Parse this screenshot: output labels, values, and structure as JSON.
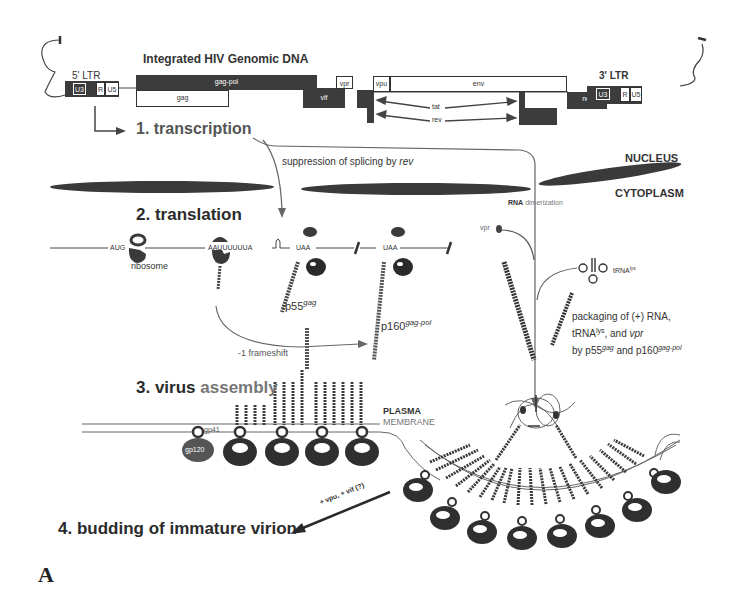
{
  "figure": {
    "panel_label": "A",
    "genome_title": "Integrated HIV Genomic DNA",
    "ltr5": {
      "label": "5' LTR",
      "segments": [
        "U3",
        "R",
        "U5"
      ]
    },
    "ltr3": {
      "label": "3' LTR",
      "segments": [
        "U3",
        "R",
        "U5"
      ]
    },
    "genes": {
      "gag_pol": "gag-pol",
      "gag": "gag",
      "vif": "vif",
      "vpr": "vpr",
      "vpu": "vpu",
      "env": "env",
      "tat": "tat",
      "rev": "rev",
      "nef": "nef"
    },
    "steps": {
      "s1": "1. transcription",
      "s2": "2. translation",
      "s3_bold": "3. virus",
      "s3_grey": "assembly",
      "s4": "4. budding of immature virion"
    },
    "annotations": {
      "splicing_prefix": "suppression of splicing by ",
      "splicing_italic": "rev",
      "nucleus": "NUCLEUS",
      "cytoplasm": "CYTOPLASM",
      "rna_dimer_bold": "RNA",
      "rna_dimer_rest": "dimerization",
      "vpr_small": "vpr",
      "trna_base": "tRNA",
      "trna_sup": "lys",
      "aug": "AUG",
      "ribosome": "ribosome",
      "slippery": "AAUUUUUUA",
      "uaa1": "UAA",
      "uaa2": "UAA",
      "p55_base": "p55",
      "p55_sup": "gag",
      "p160_base": "p160",
      "p160_sup": "gag-pol",
      "frameshift": "-1 frameshift",
      "packaging_line1": "packaging of (+) RNA,",
      "packaging_line2_a": "tRNA",
      "packaging_line2_sup": "lys",
      "packaging_line2_b": ", and ",
      "packaging_line2_it": "vpr",
      "packaging_line3_a": "by p55",
      "packaging_line3_sup1": "gag",
      "packaging_line3_b": " and p160",
      "packaging_line3_sup2": "gag-pol",
      "plasma": "PLASMA",
      "membrane": "MEMBRANE",
      "gp41": "gp41",
      "gp120": "gp120",
      "budding_arrow": "+ vpu, + vif (?)"
    },
    "colors": {
      "dark_fill": "#3c3c3c",
      "line": "#555555",
      "text": "#2a2a2a",
      "grey_text": "#777777"
    }
  }
}
